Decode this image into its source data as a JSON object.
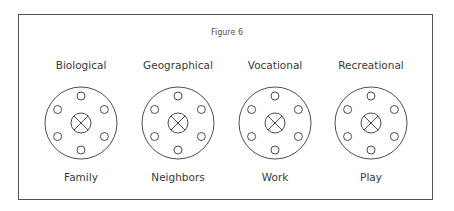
{
  "figure": {
    "title": "Figure 6",
    "colors": {
      "stroke": "#3a3a3a",
      "text": "#3a3a3a",
      "frame": "#555555",
      "background": "#ffffff"
    },
    "groups": [
      {
        "category": "Biological",
        "example": "Family",
        "cx": 81,
        "cy": 123
      },
      {
        "category": "Geographical",
        "example": "Neighbors",
        "cx": 178,
        "cy": 123
      },
      {
        "category": "Vocational",
        "example": "Work",
        "cx": 275,
        "cy": 123
      },
      {
        "category": "Recreational",
        "example": "Play",
        "cx": 371,
        "cy": 123
      }
    ],
    "node_symbols": {
      "outer_circle_radius": 36,
      "satellite_radius": 4,
      "satellite_count": 6,
      "center_symbol": "circle-with-x",
      "center_radius": 10
    }
  }
}
